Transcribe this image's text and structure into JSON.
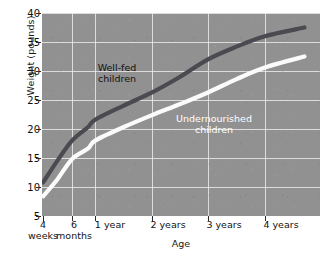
{
  "chart_data": {
    "type": "line",
    "title": "",
    "xlabel": "Age",
    "ylabel": "Weight (pounds)",
    "ylim": [
      5,
      40
    ],
    "ytick_values": [
      40,
      35,
      30,
      25,
      20,
      15,
      10,
      5
    ],
    "ytick_labels": [
      "40",
      "35",
      "30",
      "25",
      "20",
      "15",
      "10",
      "5"
    ],
    "xtick_labels": [
      {
        "line1": "4",
        "line2": "weeks"
      },
      {
        "line1": "6",
        "line2": "months"
      },
      {
        "line1": "1 year",
        "line2": ""
      },
      {
        "line1": "2 years",
        "line2": ""
      },
      {
        "line1": "3 years",
        "line2": ""
      },
      {
        "line1": "4 years",
        "line2": ""
      }
    ],
    "x_categories": [
      "4 weeks",
      "6 months",
      "1 year",
      "2 years",
      "3 years",
      "4 years"
    ],
    "grid": true,
    "legend_position": "inline-annotation",
    "background_color": "#919191",
    "grid_color": "#e9e9e9",
    "series": [
      {
        "name": "Well-fed children",
        "color": "#4a4a50",
        "label_color": "#111111",
        "points": [
          {
            "age": "4 weeks",
            "weight": 10.8
          },
          {
            "age": "2 months",
            "weight": 14.5
          },
          {
            "age": "6 months",
            "weight": 18.0
          },
          {
            "age": "9 months",
            "weight": 20.3
          },
          {
            "age": "1 year",
            "weight": 21.6
          },
          {
            "age": "1.5 years",
            "weight": 24.0
          },
          {
            "age": "2 years",
            "weight": 26.3
          },
          {
            "age": "2.5 years",
            "weight": 29.0
          },
          {
            "age": "3 years",
            "weight": 32.0
          },
          {
            "age": "3.5 years",
            "weight": 34.2
          },
          {
            "age": "4 years",
            "weight": 36.0
          },
          {
            "age": "4.5 years",
            "weight": 37.5
          }
        ]
      },
      {
        "name": "Undernourished children",
        "color": "#fbfbfb",
        "label_color": "#ffffff",
        "points": [
          {
            "age": "4 weeks",
            "weight": 8.4
          },
          {
            "age": "2 months",
            "weight": 11.3
          },
          {
            "age": "6 months",
            "weight": 14.8
          },
          {
            "age": "9 months",
            "weight": 16.6
          },
          {
            "age": "1 year",
            "weight": 18.0
          },
          {
            "age": "1.5 years",
            "weight": 20.3
          },
          {
            "age": "2 years",
            "weight": 22.4
          },
          {
            "age": "2.5 years",
            "weight": 24.3
          },
          {
            "age": "3 years",
            "weight": 26.3
          },
          {
            "age": "3.5 years",
            "weight": 28.6
          },
          {
            "age": "4 years",
            "weight": 30.6
          },
          {
            "age": "4.5 years",
            "weight": 32.5
          }
        ]
      }
    ],
    "annotations": [
      {
        "text_line1": "Well-fed",
        "text_line2": "children",
        "series": "Well-fed children"
      },
      {
        "text_line1": "Undernourished",
        "text_line2": "children",
        "series": "Undernourished children"
      }
    ]
  },
  "axis": {
    "y_title": "Weight (pounds)",
    "x_title": "Age",
    "ytick_0": "40",
    "ytick_1": "35",
    "ytick_2": "30",
    "ytick_3": "25",
    "ytick_4": "20",
    "ytick_5": "15",
    "ytick_6": "10",
    "ytick_7": "5",
    "xtick_0_l1": "4",
    "xtick_0_l2": "weeks",
    "xtick_1_l1": "6",
    "xtick_1_l2": "months",
    "xtick_2_l1": "1 year",
    "xtick_3_l1": "2 years",
    "xtick_4_l1": "3 years",
    "xtick_5_l1": "4 years"
  },
  "annotations": {
    "wellfed_l1": "Well-fed",
    "wellfed_l2": "children",
    "undernourished_l1": "Undernourished",
    "undernourished_l2": "children"
  }
}
